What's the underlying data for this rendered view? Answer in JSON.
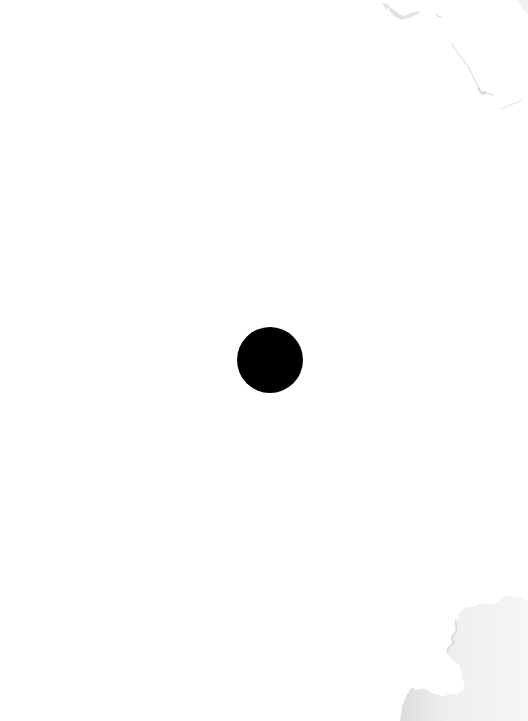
{
  "scene": {
    "description": "White paper sheet with a single black dot at center and faint gray stains at top-right and bottom-right corners",
    "background_color": "#ffffff",
    "dot": {
      "shape": "circle",
      "color": "#000000",
      "center_x": 270,
      "center_y": 360,
      "radius": 33
    },
    "stains": [
      {
        "position": "top-right",
        "color": "#d8d8d8"
      },
      {
        "position": "bottom-right",
        "color": "#e4e4e4"
      }
    ]
  }
}
